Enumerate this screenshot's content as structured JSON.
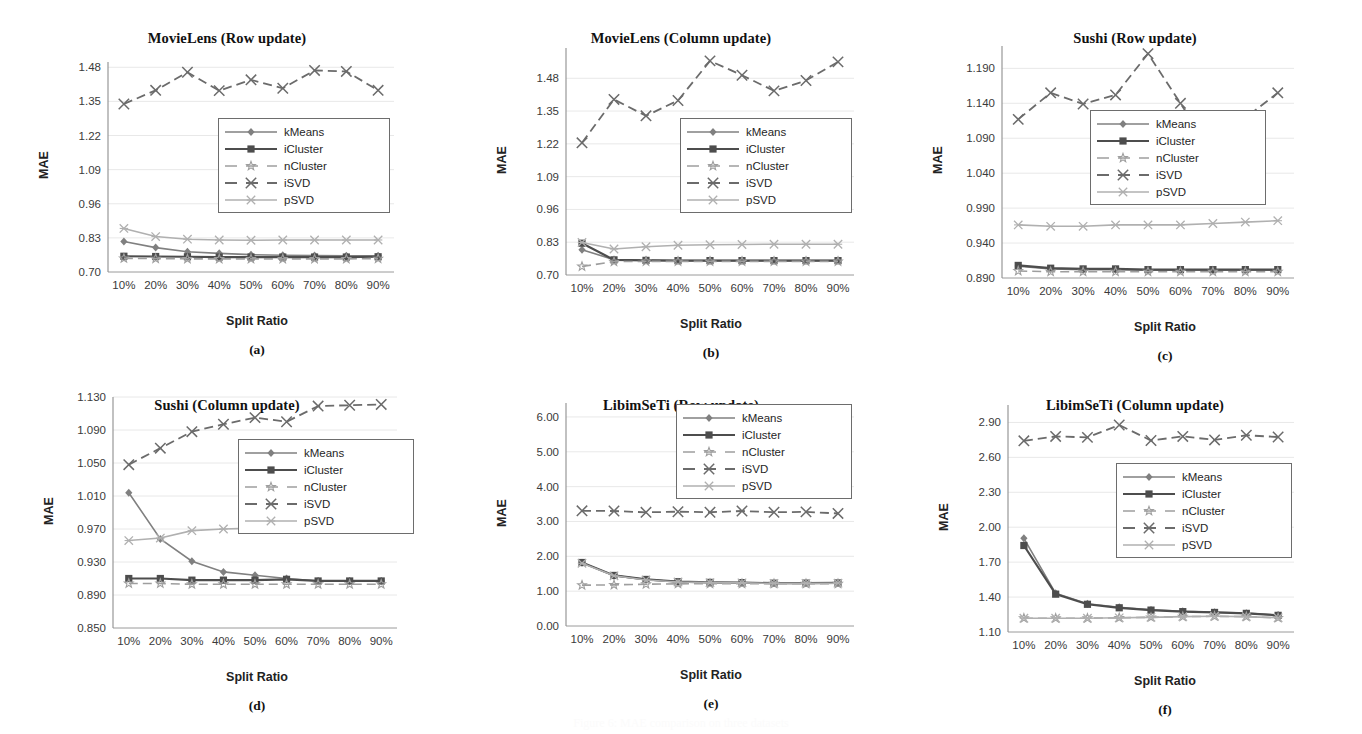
{
  "figure": {
    "axis_label_y": "MAE",
    "axis_label_x": "Split Ratio",
    "ghost_caption": "Figure 6: MAE comparison on three datasets",
    "series_defs": [
      {
        "key": "kMeans",
        "label": "kMeans",
        "color": "#808080",
        "dash": "none",
        "marker": "diamond",
        "width": 1.6
      },
      {
        "key": "iCluster",
        "label": "iCluster",
        "color": "#4d4d4d",
        "dash": "none",
        "marker": "square",
        "width": 2.2
      },
      {
        "key": "nCluster",
        "label": "nCluster",
        "color": "#9e9e9e",
        "dash": "long",
        "marker": "star",
        "width": 1.6
      },
      {
        "key": "iSVD",
        "label": "iSVD",
        "color": "#6b6b6b",
        "dash": "long",
        "marker": "cross",
        "width": 1.8
      },
      {
        "key": "pSVD",
        "label": "pSVD",
        "color": "#b0b0b0",
        "dash": "none",
        "marker": "xbox",
        "width": 1.6
      }
    ]
  },
  "chart_data": [
    {
      "id": "a",
      "type": "line",
      "title": "MovieLens (Row update)",
      "panel_letter": "(a)",
      "xlabel": "Split Ratio",
      "ylabel": "MAE",
      "categories": [
        "10%",
        "20%",
        "30%",
        "40%",
        "50%",
        "60%",
        "70%",
        "80%",
        "90%"
      ],
      "yticks": [
        0.7,
        0.83,
        0.96,
        1.09,
        1.22,
        1.35,
        1.48
      ],
      "ytick_labels": [
        "0.70",
        "0.83",
        "0.96",
        "1.09",
        "1.22",
        "1.35",
        "1.48"
      ],
      "ylim": [
        0.7,
        1.5
      ],
      "grid": true,
      "legend_position": "center-right",
      "series": [
        {
          "name": "kMeans",
          "values": [
            0.816,
            0.793,
            0.777,
            0.771,
            0.766,
            0.764,
            0.763,
            0.762,
            0.762
          ]
        },
        {
          "name": "iCluster",
          "values": [
            0.76,
            0.759,
            0.758,
            0.757,
            0.757,
            0.757,
            0.757,
            0.757,
            0.758
          ]
        },
        {
          "name": "nCluster",
          "values": [
            0.752,
            0.751,
            0.75,
            0.75,
            0.75,
            0.75,
            0.75,
            0.75,
            0.751
          ]
        },
        {
          "name": "iSVD",
          "values": [
            1.34,
            1.392,
            1.461,
            1.391,
            1.432,
            1.4,
            1.468,
            1.464,
            1.392
          ]
        },
        {
          "name": "pSVD",
          "values": [
            0.866,
            0.835,
            0.825,
            0.822,
            0.821,
            0.822,
            0.822,
            0.822,
            0.822
          ]
        }
      ]
    },
    {
      "id": "b",
      "type": "line",
      "title": "MovieLens (Column update)",
      "panel_letter": "(b)",
      "xlabel": "Split Ratio",
      "ylabel": "MAE",
      "categories": [
        "10%",
        "20%",
        "30%",
        "40%",
        "50%",
        "60%",
        "70%",
        "80%",
        "90%"
      ],
      "yticks": [
        0.7,
        0.83,
        0.96,
        1.09,
        1.22,
        1.35,
        1.48
      ],
      "ytick_labels": [
        "0.70",
        "0.83",
        "0.96",
        "1.09",
        "1.22",
        "1.35",
        "1.48"
      ],
      "ylim": [
        0.7,
        1.6
      ],
      "grid": true,
      "legend_position": "center-right",
      "series": [
        {
          "name": "kMeans",
          "values": [
            0.8,
            0.761,
            0.759,
            0.757,
            0.757,
            0.757,
            0.757,
            0.757,
            0.757
          ]
        },
        {
          "name": "iCluster",
          "values": [
            0.826,
            0.76,
            0.758,
            0.757,
            0.757,
            0.757,
            0.757,
            0.757,
            0.757
          ]
        },
        {
          "name": "nCluster",
          "values": [
            0.734,
            0.753,
            0.754,
            0.754,
            0.754,
            0.754,
            0.754,
            0.754,
            0.754
          ]
        },
        {
          "name": "iSVD",
          "values": [
            1.224,
            1.396,
            1.331,
            1.392,
            1.549,
            1.492,
            1.43,
            1.471,
            1.545
          ]
        },
        {
          "name": "pSVD",
          "values": [
            0.829,
            0.803,
            0.812,
            0.818,
            0.82,
            0.821,
            0.822,
            0.822,
            0.822
          ]
        }
      ]
    },
    {
      "id": "c",
      "type": "line",
      "title": "Sushi (Row update)",
      "panel_letter": "(c)",
      "xlabel": "Split Ratio",
      "ylabel": "MAE",
      "categories": [
        "10%",
        "20%",
        "30%",
        "40%",
        "50%",
        "60%",
        "70%",
        "80%",
        "90%"
      ],
      "yticks": [
        0.89,
        0.94,
        0.99,
        1.04,
        1.09,
        1.14,
        1.19
      ],
      "ytick_labels": [
        "0.890",
        "0.940",
        "0.990",
        "1.040",
        "1.090",
        "1.140",
        "1.190"
      ],
      "ylim": [
        0.89,
        1.222
      ],
      "grid": true,
      "legend_position": "center",
      "series": [
        {
          "name": "kMeans",
          "values": [
            0.907,
            0.903,
            0.902,
            0.902,
            0.901,
            0.901,
            0.901,
            0.901,
            0.901
          ]
        },
        {
          "name": "iCluster",
          "values": [
            0.908,
            0.904,
            0.903,
            0.903,
            0.902,
            0.902,
            0.902,
            0.902,
            0.902
          ]
        },
        {
          "name": "nCluster",
          "values": [
            0.9,
            0.899,
            0.899,
            0.899,
            0.899,
            0.899,
            0.899,
            0.899,
            0.899
          ]
        },
        {
          "name": "iSVD",
          "values": [
            1.117,
            1.155,
            1.139,
            1.152,
            1.211,
            1.14,
            1.067,
            1.119,
            1.155
          ]
        },
        {
          "name": "pSVD",
          "values": [
            0.966,
            0.964,
            0.964,
            0.966,
            0.966,
            0.966,
            0.968,
            0.97,
            0.972
          ]
        }
      ]
    },
    {
      "id": "d",
      "type": "line",
      "title": "Sushi (Column update)",
      "panel_letter": "(d)",
      "xlabel": "Split Ratio",
      "ylabel": "MAE",
      "categories": [
        "10%",
        "20%",
        "30%",
        "40%",
        "50%",
        "60%",
        "70%",
        "80%",
        "90%"
      ],
      "yticks": [
        0.85,
        0.89,
        0.93,
        0.97,
        1.01,
        1.05,
        1.09,
        1.13
      ],
      "ytick_labels": [
        "0.850",
        "0.890",
        "0.930",
        "0.970",
        "1.010",
        "1.050",
        "1.090",
        "1.130"
      ],
      "ylim": [
        0.85,
        1.13
      ],
      "grid": true,
      "legend_position": "center-right",
      "series": [
        {
          "name": "kMeans",
          "values": [
            1.014,
            0.958,
            0.931,
            0.918,
            0.914,
            0.91,
            0.907,
            0.907,
            0.907
          ]
        },
        {
          "name": "iCluster",
          "values": [
            0.91,
            0.91,
            0.908,
            0.908,
            0.908,
            0.909,
            0.907,
            0.907,
            0.907
          ]
        },
        {
          "name": "nCluster",
          "values": [
            0.904,
            0.904,
            0.903,
            0.903,
            0.903,
            0.903,
            0.903,
            0.903,
            0.903
          ]
        },
        {
          "name": "iSVD",
          "values": [
            1.048,
            1.068,
            1.088,
            1.097,
            1.105,
            1.1,
            1.119,
            1.12,
            1.121
          ]
        },
        {
          "name": "pSVD",
          "values": [
            0.956,
            0.959,
            0.968,
            0.97,
            0.971,
            0.972,
            0.973,
            0.973,
            0.973
          ]
        }
      ]
    },
    {
      "id": "e",
      "type": "line",
      "title": "LibimSeTi (Row update)",
      "panel_letter": "(e)",
      "xlabel": "Split Ratio",
      "ylabel": "MAE",
      "categories": [
        "10%",
        "20%",
        "30%",
        "40%",
        "50%",
        "60%",
        "70%",
        "80%",
        "90%"
      ],
      "yticks": [
        0.0,
        1.0,
        2.0,
        3.0,
        4.0,
        5.0,
        6.0
      ],
      "ytick_labels": [
        "0.00",
        "1.00",
        "2.00",
        "3.00",
        "4.00",
        "5.00",
        "6.00"
      ],
      "ylim": [
        0.0,
        6.4
      ],
      "grid": true,
      "legend_position": "top-right",
      "series": [
        {
          "name": "kMeans",
          "values": [
            1.815,
            1.445,
            1.33,
            1.268,
            1.248,
            1.242,
            1.226,
            1.228,
            1.233
          ]
        },
        {
          "name": "iCluster",
          "values": [
            1.822,
            1.451,
            1.336,
            1.272,
            1.252,
            1.245,
            1.229,
            1.231,
            1.236
          ]
        },
        {
          "name": "nCluster",
          "values": [
            1.172,
            1.18,
            1.2,
            1.21,
            1.212,
            1.212,
            1.212,
            1.212,
            1.212
          ]
        },
        {
          "name": "iSVD",
          "values": [
            3.305,
            3.3,
            3.262,
            3.28,
            3.265,
            3.3,
            3.265,
            3.275,
            3.23
          ]
        },
        {
          "name": "pSVD",
          "values": [
            1.8,
            1.44,
            1.322,
            1.262,
            1.244,
            1.238,
            1.222,
            1.224,
            1.229
          ]
        }
      ]
    },
    {
      "id": "f",
      "type": "line",
      "title": "LibimSeTi (Column update)",
      "panel_letter": "(f)",
      "xlabel": "Split Ratio",
      "ylabel": "MAE",
      "categories": [
        "10%",
        "20%",
        "30%",
        "40%",
        "50%",
        "60%",
        "70%",
        "80%",
        "90%"
      ],
      "yticks": [
        1.1,
        1.4,
        1.7,
        2.0,
        2.3,
        2.6,
        2.9
      ],
      "ytick_labels": [
        "1.10",
        "1.40",
        "1.70",
        "2.00",
        "2.30",
        "2.60",
        "2.90"
      ],
      "ylim": [
        1.1,
        3.05
      ],
      "grid": true,
      "legend_position": "center-right",
      "series": [
        {
          "name": "kMeans",
          "values": [
            1.905,
            1.432,
            1.342,
            1.312,
            1.29,
            1.278,
            1.27,
            1.262,
            1.245
          ]
        },
        {
          "name": "iCluster",
          "values": [
            1.843,
            1.425,
            1.338,
            1.308,
            1.288,
            1.275,
            1.268,
            1.26,
            1.243
          ]
        },
        {
          "name": "nCluster",
          "values": [
            1.218,
            1.218,
            1.218,
            1.222,
            1.226,
            1.232,
            1.235,
            1.232,
            1.222
          ]
        },
        {
          "name": "iSVD",
          "values": [
            2.742,
            2.78,
            2.772,
            2.878,
            2.745,
            2.78,
            2.75,
            2.79,
            2.775
          ]
        },
        {
          "name": "pSVD",
          "values": [
            1.218,
            1.218,
            1.218,
            1.222,
            1.226,
            1.232,
            1.235,
            1.232,
            1.222
          ]
        }
      ]
    }
  ]
}
